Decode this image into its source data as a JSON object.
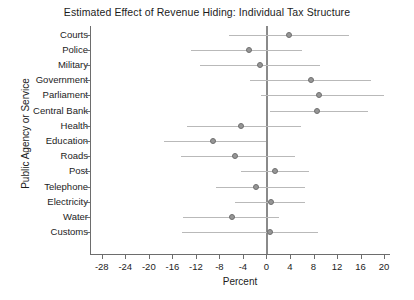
{
  "chart_data": {
    "type": "scatter",
    "title": "Estimated Effect of Revenue Hiding: Individual Tax Structure",
    "xlabel": "Percent",
    "ylabel": "Public Agency or Service",
    "xlim": [
      -30,
      21
    ],
    "xticks": [
      -28,
      -24,
      -20,
      -16,
      -12,
      -8,
      -4,
      0,
      4,
      8,
      12,
      16,
      20
    ],
    "xtick_labels": [
      "-28",
      "-24",
      "-20",
      "-16",
      "-12",
      "-8",
      "-4",
      "0",
      "4",
      "8",
      "12",
      "16",
      "20"
    ],
    "grid": false,
    "legend": null,
    "reference_line": 0,
    "categories": [
      "Courts",
      "Police",
      "Military",
      "Government",
      "Parliament",
      "Central Bank",
      "Health",
      "Education",
      "Roads",
      "Post",
      "Telephone",
      "Electricity",
      "Water",
      "Customs"
    ],
    "values": [
      3.9,
      -2.9,
      -1.1,
      7.5,
      9.0,
      8.6,
      -4.4,
      -9.1,
      -5.4,
      1.5,
      -1.7,
      0.8,
      -5.8,
      0.6
    ],
    "ci_low": [
      -6.3,
      -12.8,
      -11.3,
      -2.8,
      -0.9,
      0.6,
      -13.5,
      -17.5,
      -14.6,
      -4.4,
      -8.5,
      -5.3,
      -14.2,
      -14.3
    ],
    "ci_high": [
      14.1,
      6.1,
      9.1,
      17.7,
      19.9,
      17.3,
      5.9,
      -0.1,
      4.9,
      7.2,
      6.5,
      6.5,
      2.2,
      8.8
    ],
    "marker_color": "#969696",
    "ci_color": "#b9b9b9",
    "axis_color": "#6d6d6d"
  }
}
